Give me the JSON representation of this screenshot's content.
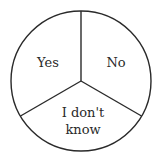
{
  "diagram": {
    "type": "pie-divided-circle",
    "segments": [
      {
        "label": "Yes"
      },
      {
        "label": "No"
      },
      {
        "label_line1": "I don't",
        "label_line2": "know"
      }
    ],
    "colors": {
      "stroke": "#2a2a2a",
      "fill": "#ffffff",
      "text": "#2a2a2a"
    }
  }
}
